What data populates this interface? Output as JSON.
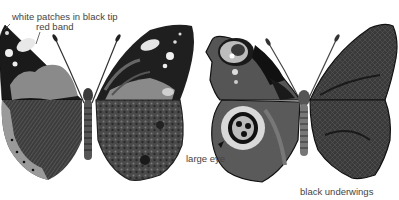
{
  "figure": {
    "left_butterfly": {
      "labels": {
        "tip": "white patches in black tip",
        "band": "red band"
      }
    },
    "right_butterfly": {
      "labels": {
        "eye": "large eye",
        "underside": "black underwings"
      }
    }
  },
  "colors": {
    "background": "#ffffff",
    "wing_black": "#1a1a1a",
    "wing_dark": "#3a3a3a",
    "band_gray": "#8a8a8a",
    "label_text": "#444444"
  }
}
